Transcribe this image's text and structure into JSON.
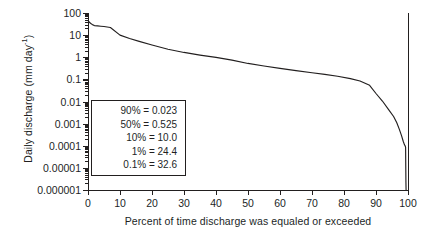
{
  "chart_data": {
    "type": "line",
    "title": "",
    "xlabel": "Percent of time discharge was equaled or exceeded",
    "ylabel": "Daily discharge (mm day−1)",
    "ylabel_base": "Daily discharge (mm day",
    "ylabel_sup": "-1",
    "ylabel_tail": ")",
    "xlim": [
      0,
      100
    ],
    "ylim": [
      1e-06,
      100
    ],
    "yscale": "log",
    "xscale": "linear",
    "grid": false,
    "legend": "none",
    "xticks": [
      0,
      10,
      20,
      30,
      40,
      50,
      60,
      70,
      80,
      90,
      100
    ],
    "xticklabels": [
      "0",
      "10",
      "20",
      "30",
      "40",
      "50",
      "60",
      "70",
      "80",
      "90",
      "100"
    ],
    "yticks": [
      100,
      10,
      1,
      0.1,
      0.01,
      0.001,
      0.0001,
      1e-05,
      1e-06
    ],
    "yticklabels": [
      "100",
      "10",
      "1",
      "0.1",
      "0.01",
      "0.001",
      "0.0001",
      "0.00001",
      "0.000001"
    ],
    "line_color": "#221f1f",
    "series": [
      {
        "name": "flow duration curve",
        "x": [
          0,
          0.3,
          0.6,
          1,
          1.5,
          2,
          3,
          4,
          5,
          7,
          10,
          13,
          16,
          20,
          25,
          30,
          35,
          40,
          45,
          50,
          55,
          60,
          65,
          70,
          74,
          78,
          82,
          85,
          88,
          90,
          92,
          94,
          95.5,
          96.5,
          97.3,
          98,
          98.5,
          98.9,
          99.1,
          99.2,
          99.25,
          99.3,
          99.35,
          99.4
        ],
        "y": [
          45,
          41,
          36,
          32.6,
          29,
          27,
          26,
          25.2,
          24.6,
          22,
          10.0,
          7.0,
          5.2,
          3.6,
          2.3,
          1.65,
          1.25,
          0.98,
          0.74,
          0.525,
          0.4,
          0.315,
          0.25,
          0.2,
          0.168,
          0.138,
          0.108,
          0.085,
          0.054,
          0.023,
          0.0105,
          0.0042,
          0.0021,
          0.0011,
          0.00055,
          0.00028,
          0.00016,
          0.00011,
          0.0001,
          9e-05,
          8.5e-05,
          1.2e-05,
          2.2e-06,
          1e-06
        ]
      }
    ],
    "annotations": {
      "box_title": "",
      "entries": [
        {
          "label": "90%",
          "sep": "=",
          "value": "0.023",
          "text": "90% = 0.023"
        },
        {
          "label": "50%",
          "sep": "=",
          "value": "0.525",
          "text": "50% = 0.525"
        },
        {
          "label": "10%",
          "sep": "=",
          "value": "10.0",
          "text": "10% = 10.0"
        },
        {
          "label": "1%",
          "sep": "=",
          "value": "24.4",
          "text": "1% = 24.4"
        },
        {
          "label": "0.1%",
          "sep": "=",
          "value": "32.6",
          "text": "0.1% = 32.6"
        }
      ]
    }
  }
}
